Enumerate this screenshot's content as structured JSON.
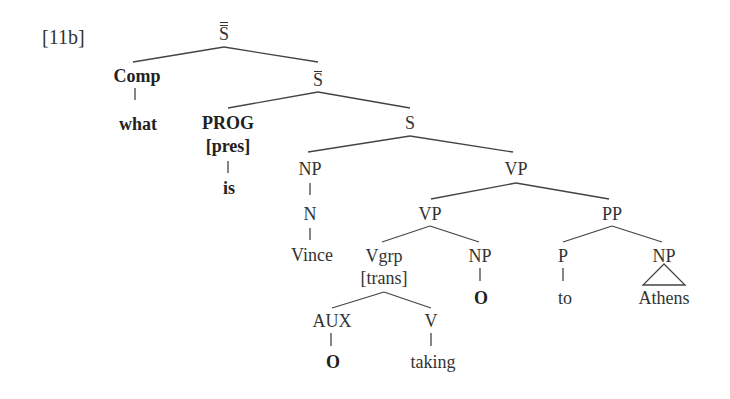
{
  "example_label": "[11b]",
  "tree": {
    "root": {
      "label": "S",
      "bars": 2
    },
    "comp": {
      "label": "Comp",
      "word": "what"
    },
    "sbar": {
      "label": "S",
      "bars": 1
    },
    "prog": {
      "label": "PROG",
      "feature": "[pres]",
      "word": "is"
    },
    "s": {
      "label": "S"
    },
    "subj_np": {
      "label": "NP",
      "n": "N",
      "word": "Vince"
    },
    "vp_top": {
      "label": "VP"
    },
    "vp_inner": {
      "label": "VP"
    },
    "vgrp": {
      "label": "Vgrp",
      "feature": "[trans]"
    },
    "aux": {
      "label": "AUX",
      "word": "O"
    },
    "v": {
      "label": "V",
      "word": "taking"
    },
    "obj_np": {
      "label": "NP",
      "word": "O"
    },
    "pp": {
      "label": "PP"
    },
    "p": {
      "label": "P",
      "word": "to"
    },
    "pp_np": {
      "label": "NP",
      "word": "Athens",
      "triangle": true
    }
  },
  "colors": {
    "line": "#444444",
    "text": "#333333",
    "background": "#ffffff"
  }
}
